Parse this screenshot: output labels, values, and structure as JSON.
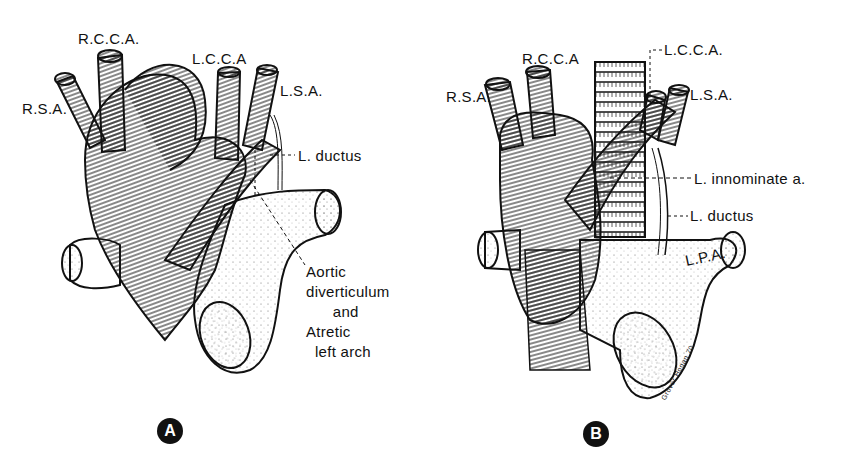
{
  "figure": {
    "panels": [
      {
        "id": "A",
        "badge": "A",
        "labels": {
          "rsa": "R.S.A.",
          "rcca": "R.C.C.A.",
          "lcca": "L.C.C.A",
          "lsa": "L.S.A.",
          "ductus": "L. ductus",
          "diverticulum": "Aortic\ndiverticulum\n      and\nAtretic\n  left arch"
        }
      },
      {
        "id": "B",
        "badge": "B",
        "labels": {
          "rsa": "R.S.A.",
          "rcca": "R.C.C.A",
          "lcca": "L.C.C.A.",
          "lsa": "L.S.A.",
          "innominate": "L. innominate a.",
          "ductus": "L. ductus",
          "lpa": "L.P.A."
        },
        "signature": "Grover Hogan 70"
      }
    ]
  }
}
